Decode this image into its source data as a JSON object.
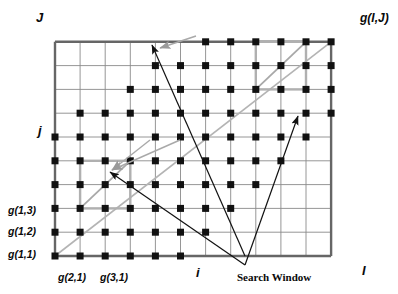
{
  "figure": {
    "type": "diagram"
  },
  "axes": {
    "y_top_label": "J",
    "y_mid_label": "j",
    "x_right_label": "I",
    "x_mid_label": "i",
    "corner_label": "g(I,J)"
  },
  "grid": {
    "left": 55,
    "bottom": 256,
    "right": 356,
    "top": 18,
    "cell_w": 25.1,
    "cell_h": 23.8,
    "cols": 12,
    "rows": 10,
    "line_color": "#8a8a8a",
    "frame_color": "#666666",
    "node_color": "#111111",
    "node_size": 7
  },
  "node_labels": [
    {
      "text": "g(1,3)",
      "x": 8,
      "y": 205
    },
    {
      "text": "g(1,2)",
      "x": 8,
      "y": 226
    },
    {
      "text": "g(1,1)",
      "x": 8,
      "y": 249
    },
    {
      "text": "g(2,1)",
      "x": 58,
      "y": 272
    },
    {
      "text": "g(3,1)",
      "x": 100,
      "y": 272
    }
  ],
  "annotations": {
    "search_window_label": "Search Window",
    "search_window_label_x": 237,
    "search_window_label_y": 272
  },
  "chart_data": {
    "type": "scatter",
    "xlabel": "i",
    "ylabel": "j",
    "xlim": [
      0,
      12
    ],
    "ylim": [
      0,
      10
    ],
    "grid": true,
    "legend": "none",
    "nodes_per_row": [
      {
        "row": 1,
        "cols": [
          1,
          2,
          3,
          4,
          5,
          6
        ]
      },
      {
        "row": 2,
        "cols": [
          1,
          2,
          3,
          4,
          5,
          6,
          7
        ]
      },
      {
        "row": 3,
        "cols": [
          1,
          2,
          3,
          4,
          5,
          6,
          7,
          8
        ]
      },
      {
        "row": 4,
        "cols": [
          1,
          2,
          3,
          4,
          5,
          6,
          7,
          8,
          9
        ]
      },
      {
        "row": 5,
        "cols": [
          1,
          2,
          3,
          4,
          5,
          6,
          7,
          8,
          9,
          10
        ]
      },
      {
        "row": 6,
        "cols": [
          1,
          2,
          3,
          4,
          5,
          6,
          7,
          8,
          9,
          10,
          11
        ]
      },
      {
        "row": 7,
        "cols": [
          2,
          3,
          4,
          5,
          6,
          7,
          8,
          9,
          10,
          11,
          12
        ]
      },
      {
        "row": 8,
        "cols": [
          4,
          5,
          6,
          7,
          8,
          9,
          10,
          11,
          12
        ]
      },
      {
        "row": 9,
        "cols": [
          5,
          6,
          7,
          8,
          9,
          10,
          11,
          12
        ]
      },
      {
        "row": 10,
        "cols": [
          7,
          8,
          9,
          10,
          11,
          12
        ]
      }
    ],
    "search_windows": [
      {
        "name": "lower-left-window",
        "i0": 2,
        "j0": 3,
        "i1": 4,
        "j1": 5
      },
      {
        "name": "upper-right-window",
        "i0": 9,
        "j0": 8,
        "i1": 11,
        "j1": 10
      }
    ],
    "arrows": [
      {
        "name": "arrow-to-lower-left-window",
        "from": [
          245,
          265
        ],
        "to": [
          110,
          172
        ]
      },
      {
        "name": "arrow-to-upper-right-window",
        "from": [
          245,
          265
        ],
        "to": [
          298,
          116
        ]
      },
      {
        "name": "arrow-diagonal-long",
        "from": [
          245,
          256
        ],
        "to": [
          152,
          45
        ]
      }
    ]
  }
}
